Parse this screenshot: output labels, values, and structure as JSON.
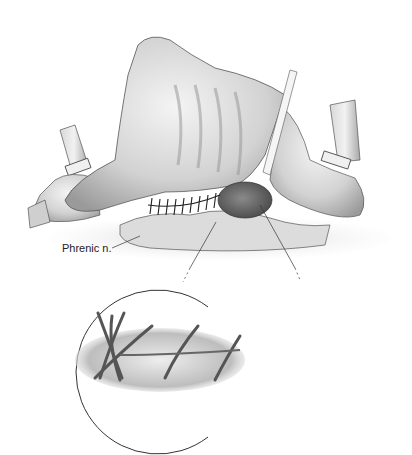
{
  "figure": {
    "type": "surgical illustration",
    "labels": {
      "phrenic_nerve": "Phrenic n."
    },
    "elements": [
      "tissue flap with ribbed surface",
      "two retracted tubular structures (left and right) with ties",
      "running suture line",
      "dark oval tissue mass",
      "magnified inset circle showing suture detail"
    ],
    "colors": {
      "background": "#ffffff",
      "tissue_light": "#e8e8e8",
      "tissue_mid": "#b8b8b8",
      "tissue_dark": "#6a6a6a",
      "line": "#333333"
    }
  }
}
